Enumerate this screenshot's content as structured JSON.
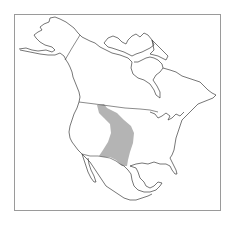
{
  "map": {
    "region": "North America",
    "type": "species range map",
    "colors": {
      "background": "#ffffff",
      "frame": "#9a9a9a",
      "outline": "#3c3c3c",
      "range_fill": "#b4b4b4"
    },
    "highlighted_range": {
      "label": "range",
      "description": "Great Plains region from southern Canada border south to Texas/northern Mexico"
    }
  }
}
